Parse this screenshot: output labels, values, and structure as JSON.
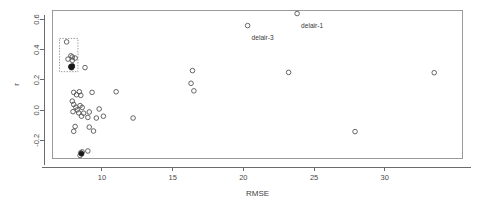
{
  "chart_data": {
    "type": "scatter",
    "title": "",
    "subtitle": "",
    "xlabel": "RMSE",
    "ylabel": "r",
    "xlim": [
      6.5,
      35.5
    ],
    "ylim": [
      -0.32,
      0.66
    ],
    "xticks": [
      10,
      15,
      20,
      25,
      30
    ],
    "xtick_labels": [
      "10",
      "15",
      "20",
      "25",
      "30"
    ],
    "yticks": [
      -0.2,
      0.0,
      0.2,
      0.4,
      0.6
    ],
    "ytick_labels": [
      "-0.2",
      "0.0",
      "0.2",
      "0.4",
      "0.6"
    ],
    "grid": false,
    "legend": null,
    "marker": "open-circle",
    "annotations": [
      {
        "text": "delair-1",
        "x": 23.8,
        "y": 0.6,
        "dx": 4,
        "dy": 8
      },
      {
        "text": "delair-3",
        "x": 20.3,
        "y": 0.52,
        "dx": 4,
        "dy": 8
      }
    ],
    "highlight_boxes": [
      {
        "x0": 7.0,
        "x1": 8.3,
        "y0": 0.255,
        "y1": 0.475,
        "style": "dashed"
      }
    ],
    "series": [
      {
        "name": "models",
        "marker": "open-circle",
        "points": [
          {
            "x": 7.5,
            "y": 0.452
          },
          {
            "x": 7.8,
            "y": 0.36
          },
          {
            "x": 7.9,
            "y": 0.352
          },
          {
            "x": 7.6,
            "y": 0.338
          },
          {
            "x": 7.9,
            "y": 0.33
          },
          {
            "x": 8.1,
            "y": 0.345
          },
          {
            "x": 8.8,
            "y": 0.282
          },
          {
            "x": 8.0,
            "y": 0.118
          },
          {
            "x": 8.4,
            "y": 0.122
          },
          {
            "x": 8.2,
            "y": 0.102
          },
          {
            "x": 8.5,
            "y": 0.098
          },
          {
            "x": 9.3,
            "y": 0.118
          },
          {
            "x": 11.0,
            "y": 0.122
          },
          {
            "x": 7.9,
            "y": 0.06
          },
          {
            "x": 8.0,
            "y": 0.038
          },
          {
            "x": 8.15,
            "y": 0.02
          },
          {
            "x": 8.45,
            "y": 0.03
          },
          {
            "x": 8.6,
            "y": 0.018
          },
          {
            "x": 8.25,
            "y": 0.002
          },
          {
            "x": 7.95,
            "y": -0.01
          },
          {
            "x": 8.35,
            "y": -0.018
          },
          {
            "x": 8.7,
            "y": -0.02
          },
          {
            "x": 9.1,
            "y": -0.012
          },
          {
            "x": 9.8,
            "y": 0.008
          },
          {
            "x": 8.55,
            "y": -0.04
          },
          {
            "x": 9.0,
            "y": -0.048
          },
          {
            "x": 9.6,
            "y": -0.052
          },
          {
            "x": 10.1,
            "y": -0.04
          },
          {
            "x": 12.2,
            "y": -0.052
          },
          {
            "x": 8.1,
            "y": -0.108
          },
          {
            "x": 8.0,
            "y": -0.14
          },
          {
            "x": 9.4,
            "y": -0.138
          },
          {
            "x": 9.1,
            "y": -0.112
          },
          {
            "x": 8.5,
            "y": -0.282
          },
          {
            "x": 8.6,
            "y": -0.276
          },
          {
            "x": 8.45,
            "y": -0.3
          },
          {
            "x": 9.0,
            "y": -0.27
          },
          {
            "x": 16.4,
            "y": 0.262
          },
          {
            "x": 16.3,
            "y": 0.178
          },
          {
            "x": 16.5,
            "y": 0.128
          },
          {
            "x": 20.3,
            "y": 0.56
          },
          {
            "x": 23.8,
            "y": 0.64
          },
          {
            "x": 23.2,
            "y": 0.25
          },
          {
            "x": 27.9,
            "y": -0.142
          },
          {
            "x": 33.5,
            "y": 0.248
          }
        ]
      },
      {
        "name": "highlighted",
        "marker": "filled-circle",
        "points": [
          {
            "x": 7.8,
            "y": 0.288
          },
          {
            "x": 7.9,
            "y": 0.292
          },
          {
            "x": 7.85,
            "y": 0.282
          },
          {
            "x": 8.55,
            "y": -0.288
          }
        ]
      }
    ]
  }
}
